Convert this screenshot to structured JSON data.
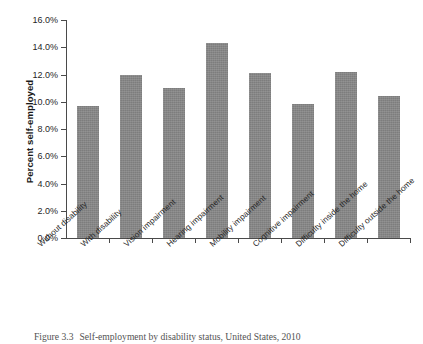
{
  "figure": {
    "caption_number": "Figure 3.3",
    "caption_text": "Self-employment by disability status, United States, 2010"
  },
  "chart_data": {
    "type": "bar",
    "title": "",
    "xlabel": "",
    "ylabel": "Percent self-employed",
    "ylim": [
      0,
      16
    ],
    "ytick_labels": [
      "0.0%",
      "2.0%",
      "4.0%",
      "6.0%",
      "8.0%",
      "10.0%",
      "12.0%",
      "14.0%",
      "16.0%"
    ],
    "ytick_values": [
      0,
      2,
      4,
      6,
      8,
      10,
      12,
      14,
      16
    ],
    "grid": false,
    "legend": null,
    "bar_color": "#7d7d7d",
    "categories": [
      "Without disability",
      "With disability",
      "Vision impairment",
      "Hearing impairment",
      "Mobility impairment",
      "Cognitive impairment",
      "Difficulty inside the home",
      "Difficulty outside the home"
    ],
    "values": [
      9.7,
      12.0,
      11.0,
      14.3,
      12.1,
      9.8,
      12.2,
      10.4
    ],
    "value_labels": [
      "9.7%",
      "12.0%",
      "11.0%",
      "14.3%",
      "12.1%",
      "9.8%",
      "12.2%",
      "10.4%"
    ]
  }
}
